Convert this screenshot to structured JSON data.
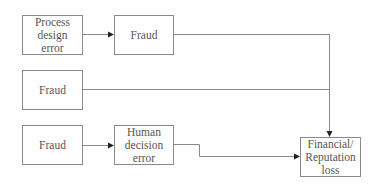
{
  "diagram": {
    "type": "flowchart",
    "nodes": [
      {
        "id": "process_design_error",
        "label": "Process\ndesign\nerror"
      },
      {
        "id": "fraud_top",
        "label": "Fraud"
      },
      {
        "id": "fraud_middle",
        "label": "Fraud"
      },
      {
        "id": "fraud_bottom",
        "label": "Fraud"
      },
      {
        "id": "human_decision_error",
        "label": "Human\ndecision\nerror"
      },
      {
        "id": "financial_reputation_loss",
        "label": "Financial/\nReputation\nloss"
      }
    ],
    "edges": [
      {
        "from": "process_design_error",
        "to": "fraud_top"
      },
      {
        "from": "fraud_top",
        "to": "financial_reputation_loss"
      },
      {
        "from": "fraud_middle",
        "to": "financial_reputation_loss"
      },
      {
        "from": "fraud_bottom",
        "to": "human_decision_error"
      },
      {
        "from": "human_decision_error",
        "to": "financial_reputation_loss"
      }
    ],
    "colors": {
      "box_border": "#8a8a8a",
      "line": "#8a8a8a",
      "arrowhead": "#222222",
      "text": "#555555"
    }
  }
}
